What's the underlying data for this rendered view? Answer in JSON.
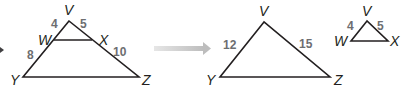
{
  "diagram": {
    "left_figure": {
      "name": "triangle-VYZ-with-midsegment-WX",
      "vertices": {
        "V": {
          "label": "V",
          "x": 69,
          "y": 21
        },
        "W": {
          "label": "W",
          "x": 54,
          "y": 40
        },
        "X": {
          "label": "X",
          "x": 92,
          "y": 40
        },
        "Y": {
          "label": "Y",
          "x": 23,
          "y": 77
        },
        "Z": {
          "label": "Z",
          "x": 139,
          "y": 77
        }
      },
      "segment_lengths": {
        "VW": "4",
        "VX": "5",
        "WY": "8",
        "XZ": "10"
      }
    },
    "arrow": {
      "color": "#c8c8c8",
      "direction": "right"
    },
    "middle_figure": {
      "name": "triangle-VYZ",
      "vertices": {
        "V": {
          "label": "V",
          "x": 264,
          "y": 22
        },
        "Y": {
          "label": "Y",
          "x": 220,
          "y": 77
        },
        "Z": {
          "label": "Z",
          "x": 330,
          "y": 77
        }
      },
      "segment_lengths": {
        "VY": "12",
        "VZ": "15"
      }
    },
    "right_figure": {
      "name": "triangle-VWX",
      "vertices": {
        "V": {
          "label": "V",
          "x": 367,
          "y": 21
        },
        "W": {
          "label": "W",
          "x": 351,
          "y": 41
        },
        "X": {
          "label": "X",
          "x": 388,
          "y": 41
        }
      },
      "segment_lengths": {
        "VW": "4",
        "VX": "5"
      }
    },
    "colors": {
      "line": "#231f20",
      "vertex_label": "#231f20",
      "length_label": "#6d6e71",
      "arrow": "#c8c8c8"
    }
  }
}
